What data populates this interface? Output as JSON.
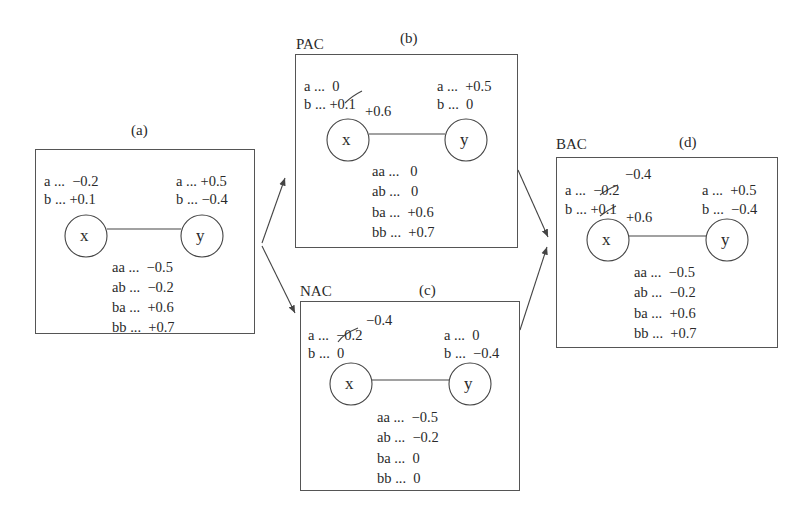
{
  "panels": [
    {
      "id": "a",
      "caption": "(a)",
      "label": "",
      "node_x": "x",
      "node_y": "y",
      "x_domain": [
        {
          "value": "a",
          "text": "a ...  −0.2",
          "crossed": false,
          "new": ""
        },
        {
          "value": "b",
          "text": "b ... +0.1",
          "crossed": false,
          "new": ""
        }
      ],
      "y_domain": [
        {
          "text": "a ... +0.5"
        },
        {
          "text": "b ... −0.4"
        }
      ],
      "edge": [
        {
          "text": "aa ...  −0.5"
        },
        {
          "text": "ab ...  −0.2"
        },
        {
          "text": "ba ...  +0.6"
        },
        {
          "text": "bb ...  +0.7"
        }
      ]
    },
    {
      "id": "b",
      "caption": "(b)",
      "label": "PAC",
      "node_x": "x",
      "node_y": "y",
      "x_domain": [
        {
          "text": "a ...  0"
        },
        {
          "text": "b ... +0.1",
          "crossed": true,
          "new": "+0.6"
        }
      ],
      "y_domain": [
        {
          "text": "a ...  +0.5"
        },
        {
          "text": "b ...  0"
        }
      ],
      "edge": [
        {
          "text": "aa ...   0"
        },
        {
          "text": "ab ...   0"
        },
        {
          "text": "ba ...  +0.6"
        },
        {
          "text": "bb ...  +0.7"
        }
      ]
    },
    {
      "id": "c",
      "caption": "(c)",
      "label": "NAC",
      "node_x": "x",
      "node_y": "y",
      "x_domain": [
        {
          "text": "a ...  −0.2",
          "crossed": true,
          "new": "−0.4"
        },
        {
          "text": "b ...  0"
        }
      ],
      "y_domain": [
        {
          "text": "a ...  0"
        },
        {
          "text": "b ...  −0.4"
        }
      ],
      "edge": [
        {
          "text": "aa ...  −0.5"
        },
        {
          "text": "ab ...  −0.2"
        },
        {
          "text": "ba ...  0"
        },
        {
          "text": "bb ...  0"
        }
      ]
    },
    {
      "id": "d",
      "caption": "(d)",
      "label": "BAC",
      "node_x": "x",
      "node_y": "y",
      "x_domain": [
        {
          "text": "a ...  −0.2",
          "crossed": true,
          "new": "−0.4"
        },
        {
          "text": "b ... +0.1",
          "crossed": true,
          "new": "+0.6"
        }
      ],
      "y_domain": [
        {
          "text": "a ...  +0.5"
        },
        {
          "text": "b ...  −0.4"
        }
      ],
      "edge": [
        {
          "text": "aa ...  −0.5"
        },
        {
          "text": "ab ...  −0.2"
        },
        {
          "text": "ba ...  +0.6"
        },
        {
          "text": "bb ...  +0.7"
        }
      ]
    }
  ],
  "arrows": [
    {
      "from": "a",
      "to": "b"
    },
    {
      "from": "a",
      "to": "c"
    },
    {
      "from": "b",
      "to": "d"
    },
    {
      "from": "c",
      "to": "d"
    }
  ]
}
